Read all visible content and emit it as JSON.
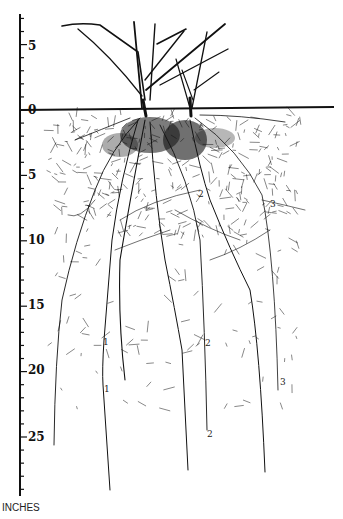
{
  "figure": {
    "title": "",
    "units_label": "INCHES",
    "ruler": {
      "ticks": [
        {
          "label": "5",
          "value": 5,
          "y": 46
        },
        {
          "label": "0",
          "value": 0,
          "y": 110
        },
        {
          "label": "5",
          "value": -5,
          "y": 175
        },
        {
          "label": "10",
          "value": -10,
          "y": 240
        },
        {
          "label": "15",
          "value": -15,
          "y": 305
        },
        {
          "label": "20",
          "value": -20,
          "y": 370
        },
        {
          "label": "25",
          "value": -25,
          "y": 437
        }
      ]
    },
    "root_labels": [
      {
        "text": "1",
        "x": 103,
        "y": 338
      },
      {
        "text": "1",
        "x": 104,
        "y": 385
      },
      {
        "text": "2",
        "x": 198,
        "y": 190
      },
      {
        "text": "2",
        "x": 205,
        "y": 339
      },
      {
        "text": "2",
        "x": 207,
        "y": 430
      },
      {
        "text": "3",
        "x": 270,
        "y": 200
      },
      {
        "text": "3",
        "x": 280,
        "y": 378
      }
    ],
    "colors": {
      "ink": "#111111",
      "background": "#ffffff"
    }
  }
}
